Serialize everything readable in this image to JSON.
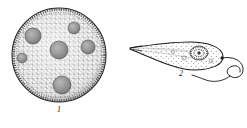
{
  "plate": {
    "background_color": "#ffffff",
    "ink_color": "#1a1a1a",
    "width": 247,
    "height": 128,
    "kind": "scientific-illustration-plate",
    "technique": "line-engraving"
  },
  "figures": [
    {
      "number": "1",
      "label": "1",
      "name": "volvox-colony",
      "description": "Spherical colony with reticulated surface mesh and darker internal daughter colonies",
      "shape": "sphere",
      "center": {
        "x": 59,
        "y": 55
      },
      "radius": 48,
      "outline_color": "#2a2a2a",
      "mesh_color": "#5a5a5a",
      "daughter_color": "#8a8a8a",
      "daughter_colonies": [
        {
          "cx": 59,
          "cy": 50,
          "r": 9
        },
        {
          "cx": 33,
          "cy": 36,
          "r": 8
        },
        {
          "cx": 22,
          "cy": 58,
          "r": 5
        },
        {
          "cx": 74,
          "cy": 28,
          "r": 6
        },
        {
          "cx": 88,
          "cy": 47,
          "r": 7
        },
        {
          "cx": 62,
          "cy": 85,
          "r": 9
        }
      ]
    },
    {
      "number": "2",
      "label": "2",
      "name": "flagellate-protozoan",
      "description": "Pear-shaped flagellate with long tapered tail, granular cytoplasm, dark nucleus and a long looping flagellum",
      "outline_color": "#1a1a1a",
      "cytoplasm_color": "#777777",
      "nucleus_color": "#333333",
      "body": {
        "tail_tip": {
          "x": 130,
          "y": 48
        },
        "anterior": {
          "x": 222,
          "y": 57
        },
        "widest": {
          "x": 205,
          "y": 53
        }
      },
      "flagellum": {
        "origin": {
          "x": 223,
          "y": 58
        },
        "loop_center": {
          "x": 232,
          "y": 66
        },
        "loop_radius": 7
      }
    }
  ]
}
